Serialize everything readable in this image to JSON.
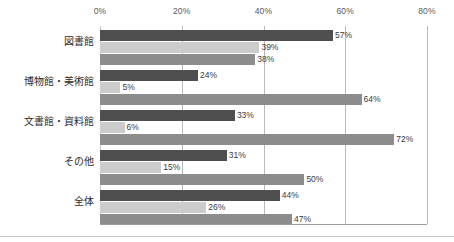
{
  "chart_data": {
    "type": "bar",
    "orientation": "horizontal",
    "title": "",
    "xlabel": "",
    "ylabel": "",
    "xlim": [
      0,
      80
    ],
    "grid": true,
    "legend": "none",
    "tick_labels": [
      "0%",
      "20%",
      "40%",
      "60%",
      "80%"
    ],
    "ticks": [
      0,
      20,
      40,
      60,
      80
    ],
    "categories": [
      "図書館",
      "博物館・美術館",
      "文書館・資料館",
      "その他",
      "全体"
    ],
    "series": [
      {
        "name": "series-1",
        "color": "#4f4f4f",
        "values": [
          57,
          24,
          33,
          31,
          44
        ]
      },
      {
        "name": "series-2",
        "color": "#cccccc",
        "values": [
          39,
          5,
          6,
          15,
          26
        ]
      },
      {
        "name": "series-3",
        "color": "#8d8d8d",
        "values": [
          38,
          64,
          72,
          50,
          47
        ]
      }
    ],
    "value_labels": [
      [
        "57%",
        "39%",
        "38%"
      ],
      [
        "24%",
        "5%",
        "64%"
      ],
      [
        "33%",
        "6%",
        "72%"
      ],
      [
        "31%",
        "15%",
        "50%"
      ],
      [
        "44%",
        "26%",
        "47%"
      ]
    ]
  }
}
